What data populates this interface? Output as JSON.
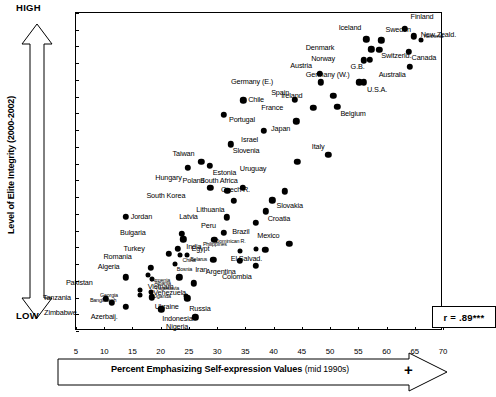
{
  "axis": {
    "y_title": "Level of Elite Integrity (2000-2002)",
    "y_high": "HIGH",
    "y_low": "LOW",
    "x_title_bold": "Percent Emphasizing Self-expression Values",
    "x_title_sub": "(mid 1990s)",
    "x_plus": "+",
    "y_ticks": [
      "1.05",
      "1.00",
      "0.95",
      "0.90",
      "0.85",
      "0.80",
      "0.75",
      "0.70",
      "0.65",
      "0.60",
      "0.55",
      "0.50",
      "0.45",
      "0.40",
      "0.35",
      "0.30",
      "0.25",
      "0.20",
      "0.15",
      "0.10"
    ],
    "x_ticks": [
      "5",
      "10",
      "15",
      "20",
      "25",
      "30",
      "35",
      "40",
      "45",
      "50",
      "55",
      "60",
      "65",
      "70"
    ]
  },
  "annotation": {
    "r_label": "r = .89***"
  },
  "chart_data": {
    "type": "scatter",
    "title": "",
    "xlabel": "Percent Emphasizing Self-expression Values (mid 1990s)",
    "ylabel": "Level of Elite Integrity (2000-2002)",
    "xlim": [
      5,
      70
    ],
    "ylim": [
      0.1,
      1.05
    ],
    "grid": false,
    "legend": null,
    "correlation": "r = .89***",
    "points": [
      {
        "label": "Finland",
        "x": 63.2,
        "y": 1.003,
        "lx": 6,
        "ly": -13
      },
      {
        "label": "New Zeald.",
        "x": 64.8,
        "y": 0.98,
        "lx": 7,
        "ly": -2
      },
      {
        "label": "Iceland",
        "x": 56.4,
        "y": 0.972,
        "lx": -3,
        "ly": -12
      },
      {
        "label": "Sweden",
        "x": 59.1,
        "y": 0.968,
        "lx": 4,
        "ly": -11
      },
      {
        "label": "Netherld.",
        "x": 66.1,
        "y": 0.968,
        "lx": 3,
        "ly": -3,
        "tiny": true
      },
      {
        "label": "Switzerld.",
        "x": 58.7,
        "y": 0.94,
        "lx": 2,
        "ly": 5
      },
      {
        "label": "Denmark",
        "x": 57.3,
        "y": 0.942,
        "lx": -35,
        "ly": -2
      },
      {
        "label": "Canada",
        "x": 63.9,
        "y": 0.934,
        "lx": 3,
        "ly": 5
      },
      {
        "label": "Norway",
        "x": 56.0,
        "y": 0.909,
        "lx": -27,
        "ly": -2
      },
      {
        "label": "G.B.",
        "x": 57.0,
        "y": 0.911,
        "lx": -3,
        "ly": 6
      },
      {
        "label": "Australia",
        "x": 64.1,
        "y": 0.89,
        "lx": -2,
        "ly": 7
      },
      {
        "label": "Austria",
        "x": 48.2,
        "y": 0.868,
        "lx": -6,
        "ly": -9
      },
      {
        "label": "Germany (W.)",
        "x": 55.2,
        "y": 0.843,
        "lx": -8,
        "ly": -8
      },
      {
        "label": "Germany (E.)",
        "x": 48.4,
        "y": 0.843,
        "lx": -46,
        "ly": -1
      },
      {
        "label": "U.S.A.",
        "x": 56.0,
        "y": 0.843,
        "lx": 3,
        "ly": 7
      },
      {
        "label": "Ireland",
        "x": 50.6,
        "y": 0.802,
        "lx": -29,
        "ly": -1
      },
      {
        "label": "Spain",
        "x": 43.8,
        "y": 0.791,
        "lx": -4,
        "ly": -8
      },
      {
        "label": "Chile",
        "x": 34.6,
        "y": 0.789,
        "lx": 5,
        "ly": -1
      },
      {
        "label": "Belgium",
        "x": 51.3,
        "y": 0.769,
        "lx": 3,
        "ly": 6
      },
      {
        "label": "France",
        "x": 47.0,
        "y": 0.766,
        "lx": -28,
        "ly": -1
      },
      {
        "label": "Portugal",
        "x": 31.2,
        "y": 0.746,
        "lx": 5,
        "ly": 4
      },
      {
        "label": "Japan",
        "x": 44.0,
        "y": 0.727,
        "lx": -4,
        "ly": 7
      },
      {
        "label": "Israel",
        "x": 38.3,
        "y": 0.698,
        "lx": -4,
        "ly": 8
      },
      {
        "label": "Slovenia",
        "x": 32.4,
        "y": 0.658,
        "lx": 2,
        "ly": 6
      },
      {
        "label": "Italy",
        "x": 49.7,
        "y": 0.626,
        "lx": -2,
        "ly": -9
      },
      {
        "label": "Taiwan",
        "x": 27.2,
        "y": 0.605,
        "lx": -5,
        "ly": -9
      },
      {
        "label": "Uruguay",
        "x": 44.2,
        "y": 0.605,
        "lx": -29,
        "ly": 6
      },
      {
        "label": "Estonia",
        "x": 28.7,
        "y": 0.593,
        "lx": 3,
        "ly": 6
      },
      {
        "label": "Hungary",
        "x": 24.8,
        "y": 0.587,
        "lx": -4,
        "ly": 9
      },
      {
        "label": "South Africa",
        "x": 34.5,
        "y": 0.528,
        "lx": -3,
        "ly": -8
      },
      {
        "label": "Poland",
        "x": 28.8,
        "y": 0.528,
        "lx": -4,
        "ly": -8
      },
      {
        "label": "Czech R.",
        "x": 42.0,
        "y": 0.517,
        "lx": -33,
        "ly": -2
      },
      {
        "label": "South Korea",
        "x": 31.8,
        "y": 0.518,
        "lx": -40,
        "ly": 4
      },
      {
        "label": "Slovakia",
        "x": 39.8,
        "y": 0.49,
        "lx": 4,
        "ly": 5
      },
      {
        "label": "Lithuania",
        "x": 32.9,
        "y": 0.489,
        "lx": -7,
        "ly": 8
      },
      {
        "label": "Croatia",
        "x": 38.6,
        "y": 0.457,
        "lx": 2,
        "ly": 7
      },
      {
        "label": "Jordan",
        "x": 13.8,
        "y": 0.441,
        "lx": 5,
        "ly": -1
      },
      {
        "label": "Latvia",
        "x": 31.7,
        "y": 0.44,
        "lx": -27,
        "ly": -1
      },
      {
        "label": "Brazil",
        "x": 36.8,
        "y": 0.423,
        "lx": -4,
        "ly": 8
      },
      {
        "label": "Peru",
        "x": 31.2,
        "y": 0.393,
        "lx": -6,
        "ly": -8
      },
      {
        "label": "Bulgaria",
        "x": 23.7,
        "y": 0.391,
        "lx": -34,
        "ly": -2
      },
      {
        "label": "Mexico",
        "x": 42.8,
        "y": 0.361,
        "lx": -8,
        "ly": -9
      },
      {
        "label": "India",
        "x": 24.0,
        "y": 0.374,
        "lx": 3,
        "ly": 7
      },
      {
        "label": "Egypt",
        "x": 29.5,
        "y": 0.373,
        "lx": -3,
        "ly": 8
      },
      {
        "label": "Dominican R.",
        "x": 36.8,
        "y": 0.346,
        "lx": -8,
        "ly": -7,
        "tiny": true
      },
      {
        "label": "El Salvad.",
        "x": 38.5,
        "y": 0.343,
        "lx": -1,
        "ly": 8
      },
      {
        "label": "Turkey",
        "x": 23.0,
        "y": 0.345,
        "lx": -31,
        "ly": -1
      },
      {
        "label": "Philippines",
        "x": 34.0,
        "y": 0.338,
        "lx": -11,
        "ly": -6,
        "tiny": true
      },
      {
        "label": "Romania",
        "x": 21.4,
        "y": 0.331,
        "lx": -35,
        "ly": 2
      },
      {
        "label": "China",
        "x": 23.5,
        "y": 0.327,
        "lx": 2,
        "ly": 6,
        "tiny": true
      },
      {
        "label": "Belarus",
        "x": 24.7,
        "y": 0.327,
        "lx": 3,
        "ly": 5,
        "tiny": true
      },
      {
        "label": "Iran",
        "x": 29.3,
        "y": 0.312,
        "lx": -4,
        "ly": 9
      },
      {
        "label": "Argentina",
        "x": 34.0,
        "y": 0.31,
        "lx": -2,
        "ly": 10
      },
      {
        "label": "Bosnia",
        "x": 22.5,
        "y": 0.299,
        "lx": 2,
        "ly": 6,
        "tiny": true
      },
      {
        "label": "Algeria",
        "x": 18.2,
        "y": 0.288,
        "lx": -29,
        "ly": -2
      },
      {
        "label": "Colombia",
        "x": 36.8,
        "y": 0.295,
        "lx": -2,
        "ly": 10
      },
      {
        "label": "Armenia",
        "x": 17.8,
        "y": 0.268,
        "lx": 3,
        "ly": 6,
        "tiny": true
      },
      {
        "label": "Vietnam",
        "x": 23.3,
        "y": 0.26,
        "lx": -4,
        "ly": 9
      },
      {
        "label": "Pakistan",
        "x": 13.8,
        "y": 0.26,
        "lx": -31,
        "ly": 5
      },
      {
        "label": "Albania",
        "x": 18.5,
        "y": 0.255,
        "lx": 2,
        "ly": 5,
        "tiny": true
      },
      {
        "label": "Venezuela",
        "x": 25.9,
        "y": 0.243,
        "lx": -6,
        "ly": 9
      },
      {
        "label": "Georgia",
        "x": 16.3,
        "y": 0.223,
        "lx": -20,
        "ly": 6,
        "tiny": true
      },
      {
        "label": "Uganda",
        "x": 18.3,
        "y": 0.218,
        "lx": 2,
        "ly": 5,
        "tiny": true
      },
      {
        "label": "Yugoslavia",
        "x": 24.5,
        "y": 0.205,
        "lx": -5,
        "ly": -7,
        "tiny": true
      },
      {
        "label": "Bangladesh",
        "x": 16.4,
        "y": 0.208,
        "lx": -22,
        "ly": 6,
        "tiny": true
      },
      {
        "label": "Ukraine",
        "x": 18.4,
        "y": 0.201,
        "lx": 3,
        "ly": 9
      },
      {
        "label": "Tanzania",
        "x": 10.3,
        "y": 0.196,
        "lx": -33,
        "ly": -2
      },
      {
        "label": "Russia",
        "x": 24.7,
        "y": 0.198,
        "lx": 2,
        "ly": 10
      },
      {
        "label": "Zimbabwe",
        "x": 11.3,
        "y": 0.184,
        "lx": -33,
        "ly": 9
      },
      {
        "label": "Azerbaij.",
        "x": 13.8,
        "y": 0.172,
        "lx": -6,
        "ly": 9
      },
      {
        "label": "Indonesia",
        "x": 20.1,
        "y": 0.165,
        "lx": 1,
        "ly": 9
      },
      {
        "label": "Nigeria",
        "x": 26.1,
        "y": 0.141,
        "lx": -5,
        "ly": 9
      }
    ]
  }
}
